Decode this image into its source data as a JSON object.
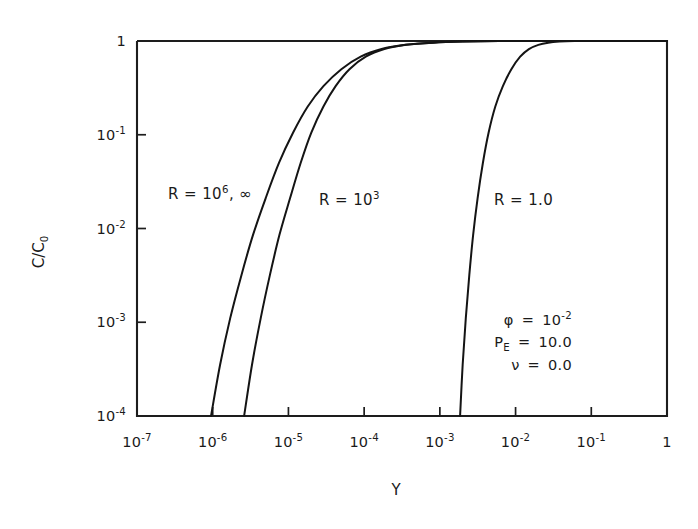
{
  "figure": {
    "background": "#ffffff",
    "ink_color": "#1a1a1a"
  },
  "chart_data": {
    "type": "line",
    "title": "",
    "subtitle": "",
    "xlabel": "Y",
    "ylabel": "C/C_0",
    "ylabel_display": "C/C",
    "ylabel_subscript": "0",
    "xscale": "log",
    "yscale": "log",
    "xlim": [
      1e-07,
      1
    ],
    "ylim": [
      0.0001,
      1
    ],
    "grid": false,
    "legend": "inline-curve-labels",
    "xticks": [
      1e-07,
      1e-06,
      1e-05,
      0.0001,
      0.001,
      0.01,
      0.1,
      1
    ],
    "xticklabels": [
      {
        "mantissa": "10",
        "exponent": "-7"
      },
      {
        "mantissa": "10",
        "exponent": "-6"
      },
      {
        "mantissa": "10",
        "exponent": "-5"
      },
      {
        "mantissa": "10",
        "exponent": "-4"
      },
      {
        "mantissa": "10",
        "exponent": "-3"
      },
      {
        "mantissa": "10",
        "exponent": "-2"
      },
      {
        "mantissa": "10",
        "exponent": "-1"
      },
      {
        "mantissa": "1",
        "exponent": ""
      }
    ],
    "yticks": [
      1,
      0.1,
      0.01,
      0.001,
      0.0001
    ],
    "yticklabels": [
      {
        "mantissa": "1",
        "exponent": ""
      },
      {
        "mantissa": "10",
        "exponent": "-1"
      },
      {
        "mantissa": "10",
        "exponent": "-2"
      },
      {
        "mantissa": "10",
        "exponent": "-3"
      },
      {
        "mantissa": "10",
        "exponent": "-4"
      }
    ],
    "series": [
      {
        "name": "R = 10^6, inf",
        "label_text": "R = 10",
        "label_exponent": "6",
        "label_tail": ", ∞",
        "points": [
          {
            "x": 9.5e-07,
            "y": 0.0001
          },
          {
            "x": 1.25e-06,
            "y": 0.00035
          },
          {
            "x": 1.7e-06,
            "y": 0.0011
          },
          {
            "x": 2.4e-06,
            "y": 0.0032
          },
          {
            "x": 3.4e-06,
            "y": 0.0085
          },
          {
            "x": 5e-06,
            "y": 0.021
          },
          {
            "x": 7.5e-06,
            "y": 0.05
          },
          {
            "x": 1.15e-05,
            "y": 0.105
          },
          {
            "x": 1.8e-05,
            "y": 0.2
          },
          {
            "x": 2.9e-05,
            "y": 0.33
          },
          {
            "x": 5e-05,
            "y": 0.5
          },
          {
            "x": 9e-05,
            "y": 0.68
          },
          {
            "x": 0.00017,
            "y": 0.82
          },
          {
            "x": 0.00035,
            "y": 0.91
          },
          {
            "x": 0.0008,
            "y": 0.96
          },
          {
            "x": 0.002,
            "y": 0.985
          },
          {
            "x": 0.006,
            "y": 0.997
          },
          {
            "x": 0.02,
            "y": 1.0
          },
          {
            "x": 1.0,
            "y": 1.0
          }
        ]
      },
      {
        "name": "R = 10^3",
        "label_text": "R = 10",
        "label_exponent": "3",
        "label_tail": "",
        "points": [
          {
            "x": 2.6e-06,
            "y": 0.0001
          },
          {
            "x": 3.3e-06,
            "y": 0.00035
          },
          {
            "x": 4.3e-06,
            "y": 0.0011
          },
          {
            "x": 5.7e-06,
            "y": 0.0032
          },
          {
            "x": 7.6e-06,
            "y": 0.0085
          },
          {
            "x": 1.05e-05,
            "y": 0.021
          },
          {
            "x": 1.45e-05,
            "y": 0.05
          },
          {
            "x": 2e-05,
            "y": 0.105
          },
          {
            "x": 2.9e-05,
            "y": 0.2
          },
          {
            "x": 4.2e-05,
            "y": 0.33
          },
          {
            "x": 6.4e-05,
            "y": 0.5
          },
          {
            "x": 0.000105,
            "y": 0.68
          },
          {
            "x": 0.000185,
            "y": 0.82
          },
          {
            "x": 0.00036,
            "y": 0.91
          },
          {
            "x": 0.00082,
            "y": 0.96
          },
          {
            "x": 0.002,
            "y": 0.985
          },
          {
            "x": 0.006,
            "y": 0.997
          },
          {
            "x": 0.02,
            "y": 1.0
          },
          {
            "x": 1.0,
            "y": 1.0
          }
        ]
      },
      {
        "name": "R = 1.0",
        "label_text": "R = 1.0",
        "label_exponent": "",
        "label_tail": "",
        "points": [
          {
            "x": 0.00185,
            "y": 0.0001
          },
          {
            "x": 0.002,
            "y": 0.00035
          },
          {
            "x": 0.0022,
            "y": 0.0011
          },
          {
            "x": 0.00245,
            "y": 0.0032
          },
          {
            "x": 0.00275,
            "y": 0.0085
          },
          {
            "x": 0.00315,
            "y": 0.021
          },
          {
            "x": 0.0037,
            "y": 0.05
          },
          {
            "x": 0.0044,
            "y": 0.105
          },
          {
            "x": 0.0054,
            "y": 0.2
          },
          {
            "x": 0.0068,
            "y": 0.33
          },
          {
            "x": 0.0088,
            "y": 0.5
          },
          {
            "x": 0.0115,
            "y": 0.68
          },
          {
            "x": 0.015,
            "y": 0.82
          },
          {
            "x": 0.02,
            "y": 0.91
          },
          {
            "x": 0.027,
            "y": 0.96
          },
          {
            "x": 0.038,
            "y": 0.985
          },
          {
            "x": 0.06,
            "y": 0.997
          },
          {
            "x": 0.11,
            "y": 1.0
          },
          {
            "x": 1.0,
            "y": 1.0
          }
        ]
      }
    ],
    "annotations": [
      {
        "id": "phi",
        "symbol": "φ",
        "equals": "=",
        "value_mantissa": "10",
        "value_exponent": "-2"
      },
      {
        "id": "peclet",
        "symbol": "P",
        "symbol_sub": "E",
        "equals": "=",
        "value_mantissa": "10.0",
        "value_exponent": ""
      },
      {
        "id": "nu",
        "symbol": "ν",
        "equals": "=",
        "value_mantissa": "0.0",
        "value_exponent": ""
      }
    ]
  }
}
